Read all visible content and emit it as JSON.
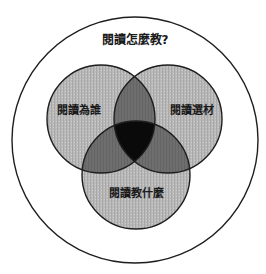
{
  "diagram": {
    "type": "venn",
    "title": "閱讀怎麼教?",
    "sets": [
      {
        "id": "who",
        "label": "閱讀為誰",
        "cx": 101,
        "cy": 119,
        "r": 54
      },
      {
        "id": "material",
        "label": "閱讀選材",
        "cx": 168,
        "cy": 119,
        "r": 54
      },
      {
        "id": "what",
        "label": "閱讀教什麼",
        "cx": 136,
        "cy": 175,
        "r": 54
      }
    ],
    "outer": {
      "cx": 135,
      "cy": 140,
      "r": 123
    },
    "colors": {
      "single": "#b9b9b9",
      "double": "#6e6e6e",
      "triple": "#0a0a0a",
      "stroke": "#1e1e1e",
      "background": "#ffffff"
    }
  }
}
